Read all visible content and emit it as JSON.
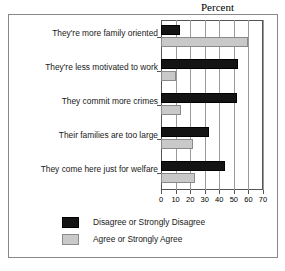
{
  "chart_data": {
    "type": "bar",
    "title": "Percent",
    "xlabel": "",
    "ylabel": "",
    "xlim": [
      0,
      70
    ],
    "xticks": [
      0,
      10,
      20,
      30,
      40,
      50,
      60,
      70
    ],
    "grid": true,
    "orientation": "horizontal",
    "legend_position": "bottom",
    "categories": [
      "They're more family oriented",
      "They're less motivated to work",
      "They commit more crimes",
      "Their families are too large",
      "They come here just for welfare"
    ],
    "series": [
      {
        "name": "Disagree or Strongly Disagree",
        "color": "#141414",
        "values": [
          13,
          53,
          52,
          33,
          44
        ]
      },
      {
        "name": "Agree or Strongly Agree",
        "color": "#c9c9c9",
        "values": [
          60,
          10,
          14,
          22,
          23
        ]
      }
    ]
  },
  "legend": {
    "items": [
      {
        "label": "Disagree or Strongly Disagree",
        "swatch": "#141414"
      },
      {
        "label": "Agree or Strongly Agree",
        "swatch": "#c9c9c9"
      }
    ]
  }
}
